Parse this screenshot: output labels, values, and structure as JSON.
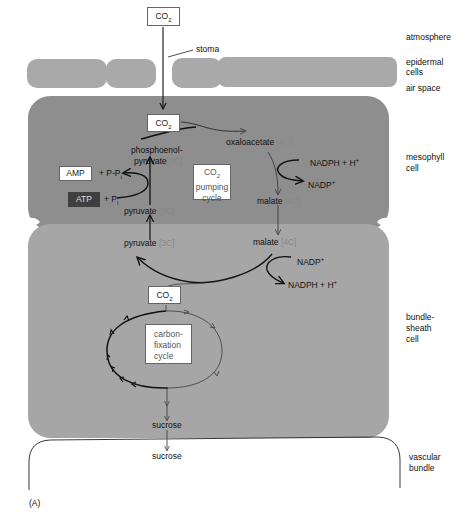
{
  "zones": {
    "atmosphere": "atmosphere",
    "epidermal": "epidermal",
    "epidermal2": "cells",
    "air_space": "air space",
    "mesophyll": "mesophyll",
    "mesophyll2": "cell",
    "bundle_sheath": "bundle-",
    "bundle_sheath2": "sheath",
    "bundle_sheath3": "cell",
    "vascular": "vascular",
    "vascular2": "bundle"
  },
  "labels": {
    "co2": "CO",
    "co2_sub": "2",
    "stoma": "stoma",
    "pep_line1": "phosphoenol-",
    "pep_line2": "pyruvate",
    "carbon_3c": "[3C]",
    "carbon_4c": "[4C]",
    "oxaloacetate": "oxaloacetate",
    "malate": "malate",
    "pyruvate": "pyruvate",
    "nadph": "NADPH + H",
    "nadp": "NADP",
    "plus": "+",
    "amp": "AMP",
    "ppi": "+ P-P",
    "atp": "ATP",
    "pi": "+ P",
    "sub_i": "i",
    "pumping_co2": "CO",
    "pumping_line2": "pumping",
    "pumping_line3": "cycle",
    "fixation_line1": "carbon-",
    "fixation_line2": "fixation",
    "fixation_line3": "cycle",
    "sucrose": "sucrose",
    "figure_label": "(A)"
  },
  "colors": {
    "mesophyll": "#8e8e8e",
    "bundle_sheath": "#a6a6a6",
    "epidermis": "#a9a9a9",
    "arrow_dark": "#111111",
    "arrow_light": "#444444"
  }
}
